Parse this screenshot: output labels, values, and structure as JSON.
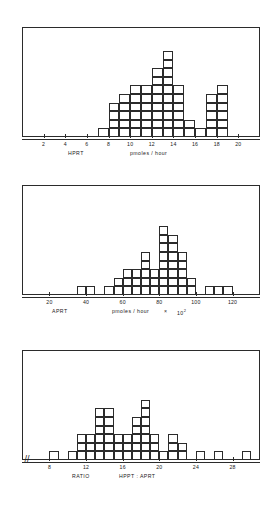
{
  "figure": {
    "kind": "block-histogram-figure",
    "panel_count": 3
  },
  "chart_data": [
    {
      "type": "bar",
      "title": "",
      "xlabel": "HPRT    pmoles / hour",
      "ylabel": "",
      "variable_label": "HPRT",
      "unit_label": "pmoles / hour",
      "grid": false,
      "legend": "none",
      "style": "stacked unit squares (block histogram)",
      "xlim": [
        0,
        22
      ],
      "ylim": [
        0,
        11
      ],
      "bin_width": 1,
      "tick_labels": [
        "2",
        "4",
        "6",
        "8",
        "10",
        "12",
        "14",
        "16",
        "18",
        "20"
      ],
      "tick_values": [
        2,
        4,
        6,
        8,
        10,
        12,
        14,
        16,
        18,
        20
      ],
      "categories": [
        7,
        8,
        9,
        10,
        11,
        12,
        13,
        14,
        15,
        16,
        17,
        18
      ],
      "values": [
        1,
        4,
        5,
        6,
        6,
        8,
        10,
        6,
        2,
        1,
        5,
        6
      ],
      "total_count": 60
    },
    {
      "type": "bar",
      "title": "",
      "xlabel": "APRT    pmoles / hour  ×  10²",
      "ylabel": "",
      "variable_label": "APRT",
      "unit_label": "pmoles / hour",
      "unit_multiplier_base": "10",
      "unit_multiplier_exponent": "2",
      "unit_multiplier_times": "×",
      "grid": false,
      "legend": "none",
      "style": "stacked unit squares (block histogram)",
      "xlim": [
        5,
        135
      ],
      "ylim": [
        0,
        11
      ],
      "bin_width": 5,
      "tick_labels": [
        "20",
        "40",
        "60",
        "80",
        "100",
        "120"
      ],
      "tick_values": [
        20,
        40,
        60,
        80,
        100,
        120
      ],
      "categories": [
        35,
        40,
        50,
        55,
        60,
        65,
        70,
        75,
        80,
        85,
        90,
        95,
        105,
        110,
        115
      ],
      "values": [
        1,
        1,
        1,
        2,
        3,
        3,
        5,
        3,
        8,
        7,
        5,
        2,
        1,
        1,
        1
      ],
      "total_count": 44
    },
    {
      "type": "bar",
      "title": "",
      "xlabel": "RATIO    HPPT : APRT",
      "ylabel": "",
      "variable_label": "RATIO",
      "unit_label": "HPPT : APRT",
      "grid": false,
      "legend": false,
      "axis_break_symbol": "//",
      "style": "stacked unit squares (block histogram)",
      "xlim": [
        5,
        31
      ],
      "ylim": [
        0,
        11
      ],
      "bin_width": 1,
      "tick_labels": [
        "8",
        "12",
        "16",
        "20",
        "24",
        "28"
      ],
      "tick_values": [
        8,
        12,
        16,
        20,
        24,
        28
      ],
      "categories": [
        8,
        10,
        11,
        12,
        13,
        14,
        15,
        16,
        17,
        18,
        19,
        20,
        21,
        22,
        24,
        26,
        29
      ],
      "values": [
        1,
        1,
        3,
        3,
        6,
        6,
        3,
        3,
        5,
        7,
        3,
        1,
        3,
        2,
        1,
        1,
        1
      ],
      "total_count": 50
    }
  ]
}
